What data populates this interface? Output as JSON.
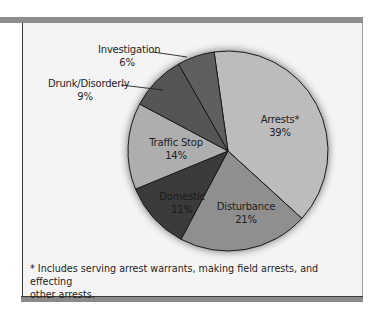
{
  "chart_data": {
    "type": "pie",
    "title": "",
    "start_angle_deg": -8,
    "direction": "clockwise",
    "slices": [
      {
        "label": "Arrests*",
        "value": 39,
        "display": "39%",
        "color": "#bcbcbc"
      },
      {
        "label": "Disturbance",
        "value": 21,
        "display": "21%",
        "color": "#8f8f8f"
      },
      {
        "label": "Domestic",
        "value": 11,
        "display": "11%",
        "color": "#3a3a3a"
      },
      {
        "label": "Traffic Stop",
        "value": 14,
        "display": "14%",
        "color": "#aeaeae"
      },
      {
        "label": "Drunk/Disorderly",
        "value": 9,
        "display": "9%",
        "color": "#555555"
      },
      {
        "label": "Investigation",
        "value": 6,
        "display": "6%",
        "color": "#5e5e5e"
      }
    ],
    "footnote": "* Includes serving arrest warrants, making field arrests, and effecting other arrests."
  },
  "labels": {
    "arrests": {
      "name": "Arrests*",
      "pct": "39%"
    },
    "disturbance": {
      "name": "Disturbance",
      "pct": "21%"
    },
    "domestic": {
      "name": "Domestic",
      "pct": "11%"
    },
    "traffic": {
      "name": "Traffic Stop",
      "pct": "14%"
    },
    "drunk": {
      "name": "Drunk/Disorderly",
      "pct": "9%"
    },
    "investigation": {
      "name": "Investigation",
      "pct": "6%"
    }
  },
  "footnote": {
    "line1": "* Includes serving arrest warrants, making field arrests, and effecting",
    "line2": "other arrests."
  }
}
